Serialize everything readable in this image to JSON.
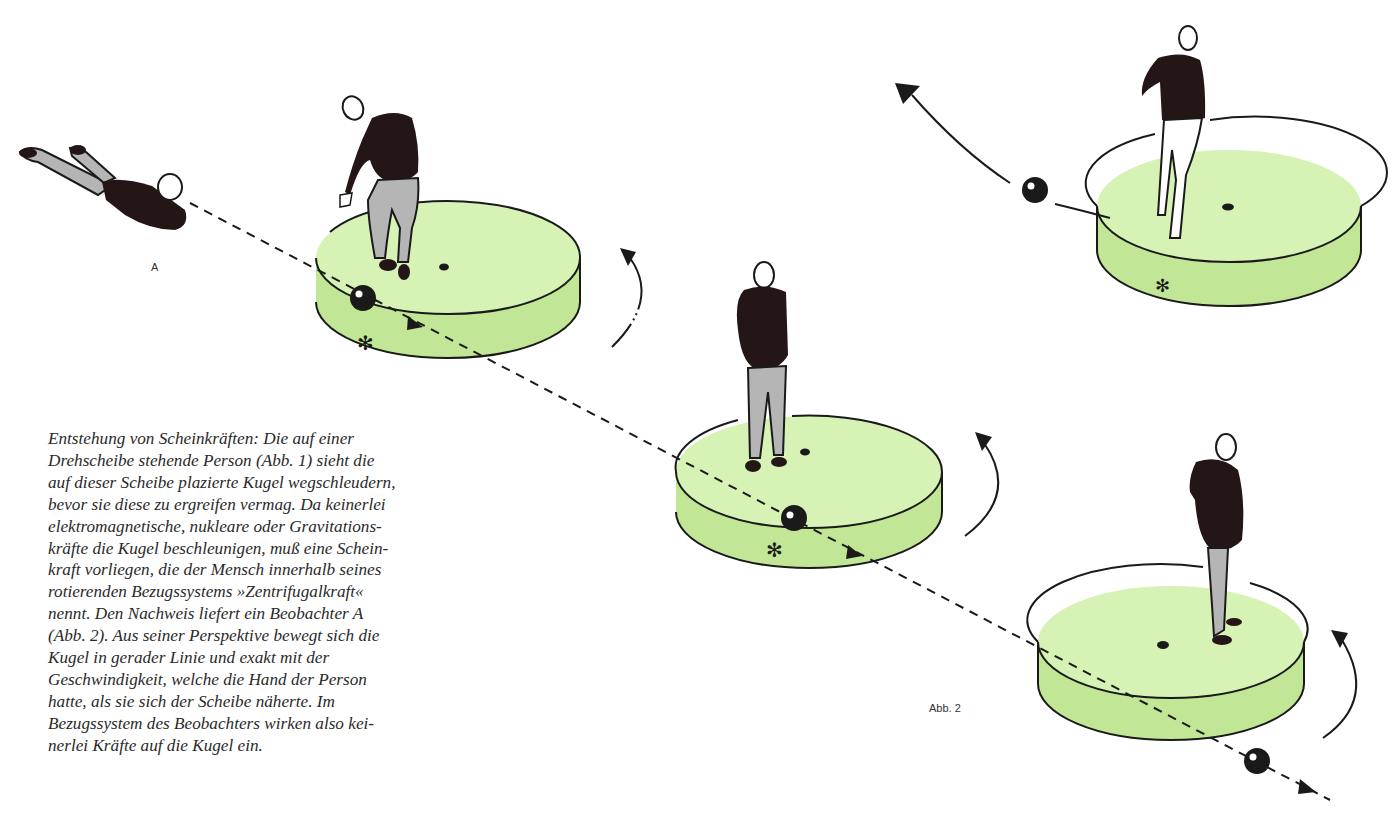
{
  "figure": {
    "label_observer": "A",
    "label_figure": "Abb. 2",
    "colors": {
      "disc_top": "#d6f2b4",
      "disc_side": "#c1e695",
      "figure_dark": "#241617",
      "trousers": "#b5b5b5",
      "line": "#1a1a1a"
    },
    "icons": [
      "person-lying-icon",
      "person-on-disc-icon",
      "ball-icon",
      "asterisk-marker-icon",
      "rotation-arrow-icon",
      "trajectory-arrow-icon"
    ]
  },
  "caption": {
    "lines": [
      "Entstehung von Scheinkräften: Die auf einer",
      "Drehscheibe stehende Person (Abb. 1) sieht die",
      "auf dieser Scheibe plazierte Kugel wegschleudern,",
      "bevor sie diese zu ergreifen vermag. Da keinerlei",
      "elektromagnetische, nukleare oder Gravitations-",
      "kräfte die Kugel beschleunigen, muß eine Schein-",
      "kraft vorliegen, die der Mensch innerhalb seines",
      "rotierenden Bezugssystems »Zentrifugalkraft«",
      "nennt. Den Nachweis liefert ein Beobachter A",
      "(Abb. 2). Aus seiner Perspektive bewegt sich die",
      "Kugel in gerader Linie und exakt mit der",
      "Geschwindigkeit, welche die Hand der Person",
      "hatte, als sie sich der Scheibe näherte. Im",
      "Bezugssystem des Beobachters wirken also kei-",
      "nerlei Kräfte auf die Kugel ein."
    ]
  }
}
